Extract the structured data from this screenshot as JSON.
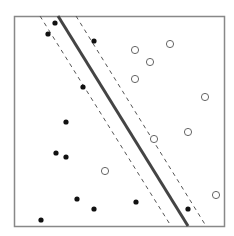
{
  "diagram": {
    "type": "svm-maximum-margin",
    "frame": {
      "x": 14,
      "y": 16,
      "width": 210,
      "height": 210,
      "stroke": "#888888"
    },
    "decision_boundary": {
      "x1": 58,
      "y1": 16,
      "x2": 188,
      "y2": 226,
      "stroke": "#444444",
      "width": 3
    },
    "margin_left": {
      "x1": 40,
      "y1": 16,
      "x2": 171,
      "y2": 226,
      "stroke": "#555555",
      "dash": "4,4"
    },
    "margin_right": {
      "x1": 76,
      "y1": 16,
      "x2": 206,
      "y2": 226,
      "stroke": "#555555",
      "dash": "4,4"
    },
    "class_filled": {
      "color": "#111111",
      "points": [
        [
          55,
          23
        ],
        [
          48,
          34
        ],
        [
          94,
          41
        ],
        [
          83,
          87
        ],
        [
          66,
          122
        ],
        [
          56,
          153
        ],
        [
          66,
          157
        ],
        [
          77,
          199
        ],
        [
          94,
          209
        ],
        [
          41,
          220
        ],
        [
          136,
          202
        ],
        [
          188,
          209
        ]
      ]
    },
    "class_open": {
      "color": "#666666",
      "points": [
        [
          135,
          50
        ],
        [
          170,
          44
        ],
        [
          150,
          62
        ],
        [
          135,
          79
        ],
        [
          205,
          97
        ],
        [
          188,
          132
        ],
        [
          154,
          139
        ],
        [
          105,
          171
        ],
        [
          216,
          195
        ]
      ]
    }
  }
}
